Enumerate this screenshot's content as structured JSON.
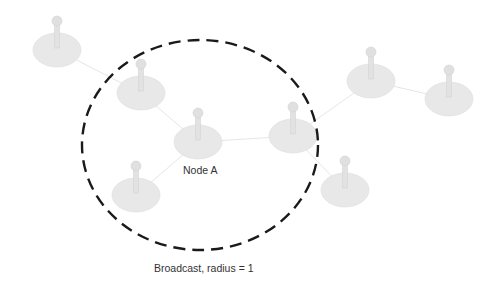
{
  "diagram": {
    "nodes": [
      {
        "id": "n1",
        "x": 57,
        "y": 50
      },
      {
        "id": "n2",
        "x": 141,
        "y": 93
      },
      {
        "id": "nodeA",
        "x": 198,
        "y": 142,
        "label": "Node A"
      },
      {
        "id": "n4",
        "x": 293,
        "y": 136
      },
      {
        "id": "n5",
        "x": 136,
        "y": 195
      },
      {
        "id": "n6",
        "x": 345,
        "y": 190
      },
      {
        "id": "n7",
        "x": 371,
        "y": 81
      },
      {
        "id": "n8",
        "x": 449,
        "y": 99
      }
    ],
    "edges": [
      [
        "n1",
        "n2"
      ],
      [
        "n2",
        "nodeA"
      ],
      [
        "nodeA",
        "n4"
      ],
      [
        "nodeA",
        "n5"
      ],
      [
        "n4",
        "n7"
      ],
      [
        "n7",
        "n8"
      ],
      [
        "n4",
        "n6"
      ]
    ],
    "broadcast_circle": {
      "cx": 200,
      "cy": 145,
      "rx": 118,
      "ry": 105,
      "color": "#1a1a1a"
    },
    "node_label": "Node A",
    "caption": "Broadcast, radius = 1",
    "colors": {
      "node_fill": "#e6e6e6",
      "edge": "#e4e4e4"
    }
  }
}
